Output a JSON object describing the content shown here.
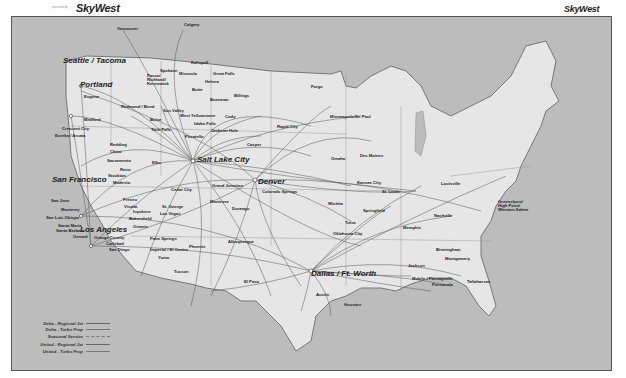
{
  "header": {
    "left_logo": {
      "prefix": "operated by",
      "brand": "SkyWest"
    },
    "right_logo": {
      "brand": "SkyWest"
    }
  },
  "map": {
    "hubs": [
      {
        "name": "Seattle / Tacoma"
      },
      {
        "name": "Portland"
      },
      {
        "name": "San Francisco"
      },
      {
        "name": "Los Angeles"
      },
      {
        "name": "Salt Lake City"
      },
      {
        "name": "Denver"
      },
      {
        "name": "Dallas / Ft. Worth"
      }
    ],
    "cities": [
      "Vancouver",
      "Calgary",
      "Spokane",
      "Pasco/ Richland/ Kennewick",
      "Kalispell",
      "Missoula",
      "Great Falls",
      "Helena",
      "Butte",
      "Bozeman",
      "Billings",
      "Eugene",
      "Redmond / Bend",
      "Medford",
      "Crescent City",
      "Eureka / Arcata",
      "Redding",
      "Chico",
      "Sacramento",
      "Reno",
      "Stockton",
      "Modesto",
      "Elko",
      "Boise",
      "Sun Valley",
      "Twin Falls",
      "West Yellowstone",
      "Idaho Falls",
      "Pocatello",
      "Jackson Hole",
      "Cody",
      "Rapid City",
      "Casper",
      "Fargo",
      "Minneapolis/St. Paul",
      "Des Moines",
      "Omaha",
      "San Jose",
      "Monterey",
      "San Luis Obispo",
      "Santa Maria",
      "Santa Barbara",
      "Oxnard",
      "Orange County",
      "Carlsbad",
      "San Diego",
      "Fresno",
      "Visalia",
      "Inyokern",
      "Bakersfield",
      "Ontario",
      "Palm Springs",
      "Imperial / El Centro",
      "Yuma",
      "Cedar City",
      "St. George",
      "Las Vegas",
      "Grand Junction",
      "Montrose",
      "Durango",
      "Colorado Springs",
      "Phoenix",
      "Tucson",
      "Albuquerque",
      "El Paso",
      "Wichita",
      "Kansas City",
      "St. Louis",
      "Springfield",
      "Tulsa",
      "Oklahoma City",
      "Louisville",
      "Nashville",
      "Memphis",
      "Greensboro/ High Point/ Winston-Salem",
      "Birmingham",
      "Montgomery",
      "Jackson",
      "Mobile / Pascagoula",
      "Pensacola",
      "Tallahassee",
      "Austin",
      "Houston"
    ],
    "colors": {
      "water": "#bcbcbc",
      "land": "#e6e6e6",
      "route": "#555555",
      "border": "#8a8a8a"
    }
  },
  "legend": {
    "items": [
      {
        "label": "Delta - Regional Jet",
        "style": "solid"
      },
      {
        "label": "Delta - Turbo Prop",
        "style": "thin"
      },
      {
        "label": "Seasonal Service",
        "style": "dashed"
      },
      {
        "label": "United - Regional Jet",
        "style": "solid"
      },
      {
        "label": "United - Turbo Prop",
        "style": "thin"
      }
    ]
  }
}
